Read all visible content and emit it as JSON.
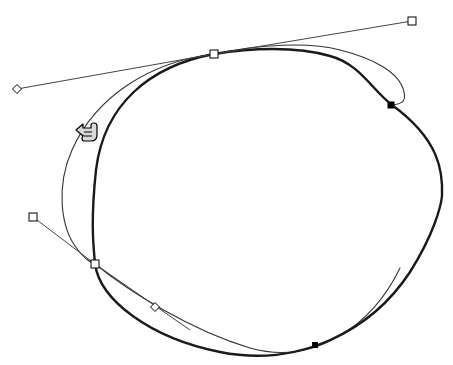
{
  "app": {
    "title": "Vector Path Editor Canvas",
    "background_color": "#ffffff",
    "canvas_width": 453,
    "canvas_height": 365
  },
  "colors": {
    "stroke_primary": "#1a1a1a",
    "stroke_secondary": "#555555",
    "handle_fill": "#ffffff",
    "handle_stroke": "#000000",
    "anchor_selected_fill": "#000000",
    "cursor_fill": "#d9d9d9",
    "cursor_stroke": "#000000"
  },
  "shapes": {
    "thick_path": {
      "name": "edited-path-thick",
      "label": "Thick bezier outline path",
      "stroke_width": 2.4,
      "color": "#1a1a1a",
      "d": "M 214 54 C 150 66 104 104 96 170 C 90 226 94 250 95 264 C 100 300 150 338 220 352 C 300 368 372 330 410 272 C 434 234 441 206 442 196 C 443 172 440 140 392 105 C 372 90 360 64 330 56 C 296 46 250 48 214 54 Z"
    },
    "thin_path": {
      "name": "edited-path-thin",
      "label": "Thin bezier outline path",
      "stroke_width": 1.1,
      "color": "#333333",
      "d": "M 214 54 C 150 62 96 96 72 150 C 56 186 60 228 78 250 C 86 260 90 262 95 264 C 130 292 190 330 250 348 C 314 366 372 326 400 268"
    },
    "thin_path_upper": {
      "name": "edited-path-thin-upper",
      "label": "Thin bezier upper right arc",
      "stroke_width": 1.1,
      "color": "#333333",
      "d": "M 214 54 C 260 44 310 42 340 50 C 372 58 400 72 404 92 C 407 104 398 104 392 105"
    }
  },
  "tangents": [
    {
      "name": "tangent-line-top-left",
      "from_anchor": "anchor-top",
      "to_handle": "handle-diamond-top-left",
      "x1": 214,
      "y1": 54,
      "x2": 17,
      "y2": 89,
      "color": "#444444",
      "width": 1
    },
    {
      "name": "tangent-line-top-right",
      "from_anchor": "anchor-top",
      "to_handle": "handle-square-top-right",
      "x1": 214,
      "y1": 54,
      "x2": 412,
      "y2": 21,
      "color": "#444444",
      "width": 1
    },
    {
      "name": "tangent-line-lower-left",
      "from_anchor": "anchor-lower-left",
      "to_handle": "handle-square-left",
      "x1": 95,
      "y1": 264,
      "x2": 33,
      "y2": 217,
      "color": "#444444",
      "width": 1
    },
    {
      "name": "tangent-line-lower-right",
      "from_anchor": "anchor-lower-left",
      "to_handle": "handle-diamond-lower",
      "x1": 95,
      "y1": 264,
      "x2": 190,
      "y2": 330,
      "color": "#444444",
      "width": 1
    }
  ],
  "anchors": [
    {
      "name": "anchor-top",
      "label": "Top anchor point",
      "shape": "square",
      "filled": false,
      "x": 214,
      "y": 54,
      "size": 8
    },
    {
      "name": "anchor-lower-left",
      "label": "Lower left anchor point",
      "shape": "square",
      "filled": false,
      "x": 95,
      "y": 264,
      "size": 8
    },
    {
      "name": "anchor-right-selected",
      "label": "Right selected anchor point",
      "shape": "square",
      "filled": true,
      "x": 391,
      "y": 105,
      "size": 6
    },
    {
      "name": "anchor-bottom-selected",
      "label": "Bottom selected anchor point",
      "shape": "square",
      "filled": true,
      "x": 315,
      "y": 345,
      "size": 5
    }
  ],
  "handles": [
    {
      "name": "handle-diamond-top-left",
      "label": "Top left control handle",
      "shape": "diamond",
      "x": 17,
      "y": 89,
      "size": 9
    },
    {
      "name": "handle-square-top-right",
      "label": "Top right control handle",
      "shape": "square",
      "x": 412,
      "y": 21,
      "size": 8
    },
    {
      "name": "handle-square-left",
      "label": "Left control handle",
      "shape": "square",
      "x": 33,
      "y": 217,
      "size": 8
    },
    {
      "name": "handle-diamond-lower",
      "label": "Lower control handle",
      "shape": "diamond",
      "x": 155,
      "y": 307,
      "size": 9
    }
  ],
  "cursor": {
    "name": "pointing-hand-cursor",
    "label": "Pointing hand cursor",
    "direction": "left",
    "x": 76,
    "y": 122,
    "width": 24,
    "height": 20
  },
  "chart_data": {
    "type": "scatter",
    "xlabel": "x (px)",
    "ylabel": "y (px)",
    "xlim": [
      0,
      453
    ],
    "ylim": [
      0,
      365
    ],
    "series": [
      {
        "name": "anchors",
        "points": [
          [
            214,
            54
          ],
          [
            95,
            264
          ],
          [
            391,
            105
          ],
          [
            315,
            345
          ]
        ]
      },
      {
        "name": "handles",
        "points": [
          [
            17,
            89
          ],
          [
            412,
            21
          ],
          [
            33,
            217
          ],
          [
            155,
            307
          ]
        ]
      }
    ]
  }
}
